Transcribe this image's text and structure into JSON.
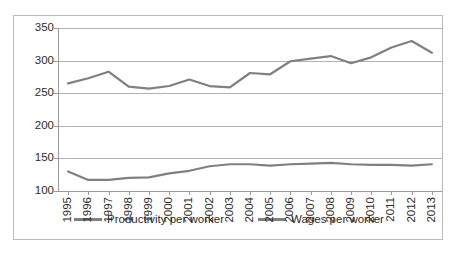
{
  "chart_data": {
    "type": "line",
    "title": "",
    "xlabel": "",
    "ylabel": "",
    "categories": [
      "1995",
      "1996",
      "1997",
      "1998",
      "1999",
      "2000",
      "2001",
      "2002",
      "2003",
      "2004",
      "2005",
      "2006",
      "2007",
      "2008",
      "2009",
      "2010",
      "2011",
      "2012",
      "2013"
    ],
    "series": [
      {
        "name": "Productivity per worker",
        "color": "#808080",
        "values": [
          265,
          273,
          283,
          260,
          257,
          261,
          271,
          261,
          259,
          281,
          279,
          299,
          303,
          307,
          296,
          305,
          320,
          330,
          312
        ]
      },
      {
        "name": "Wages per worker",
        "color": "#808080",
        "values": [
          130,
          117,
          117,
          120,
          121,
          127,
          131,
          138,
          141,
          141,
          139,
          141,
          142,
          143,
          141,
          140,
          140,
          139,
          141
        ]
      }
    ],
    "ylim": [
      100,
      350
    ],
    "yticks": [
      100,
      150,
      200,
      250,
      300,
      350
    ],
    "ytick_labels": [
      "100",
      "150",
      "200",
      "250",
      "300",
      "350"
    ],
    "grid": true,
    "legend_position": "bottom"
  }
}
